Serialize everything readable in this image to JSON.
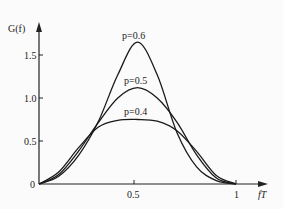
{
  "chart_data": {
    "type": "line",
    "title": "",
    "xlabel": "fT",
    "ylabel": "G(f)",
    "x_ticks": [
      "0.5",
      "1"
    ],
    "y_ticks": [
      "0",
      "0.5",
      "1.0",
      "1.5"
    ],
    "xlim": [
      0,
      1.1
    ],
    "ylim": [
      0,
      1.8
    ],
    "grid": false,
    "series": [
      {
        "name": "p=0.6",
        "x": [
          0,
          0.1,
          0.2,
          0.3,
          0.4,
          0.5,
          0.6,
          0.7,
          0.8,
          0.9,
          1.0
        ],
        "values": [
          0,
          0.09,
          0.33,
          0.72,
          1.27,
          1.65,
          1.27,
          0.6,
          0.2,
          0.04,
          0
        ]
      },
      {
        "name": "p=0.5",
        "x": [
          0,
          0.1,
          0.2,
          0.3,
          0.4,
          0.5,
          0.6,
          0.7,
          0.8,
          0.9,
          1.0
        ],
        "values": [
          0,
          0.11,
          0.38,
          0.71,
          1.0,
          1.12,
          1.0,
          0.72,
          0.34,
          0.07,
          0
        ]
      },
      {
        "name": "p=0.4",
        "x": [
          0,
          0.1,
          0.2,
          0.3,
          0.4,
          0.5,
          0.6,
          0.7,
          0.8,
          0.9,
          1.0
        ],
        "values": [
          0,
          0.14,
          0.42,
          0.66,
          0.74,
          0.75,
          0.73,
          0.62,
          0.38,
          0.1,
          0
        ]
      }
    ],
    "annotations": [
      "p=0.6",
      "p=0.5",
      "p=0.4"
    ]
  },
  "labels": {
    "y_axis": "G(f)",
    "x_axis": "fT",
    "origin": "0",
    "p06": "p=0.6",
    "p05": "p=0.5",
    "p04": "p=0.4"
  }
}
